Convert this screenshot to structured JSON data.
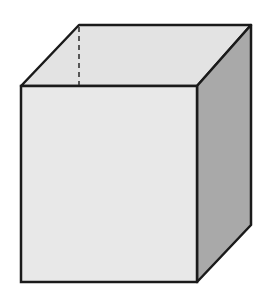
{
  "diagram": {
    "type": "cube",
    "projection": "oblique",
    "colors": {
      "background": "#ffffff",
      "front_face": "#e8e8e8",
      "top_face": "#e3e3e3",
      "side_face": "#a9a9a9",
      "edge": "#1a1a1a"
    },
    "vertices": {
      "front_top_left": [
        21,
        86
      ],
      "front_top_right": [
        197,
        86
      ],
      "front_bottom_right": [
        197,
        282
      ],
      "front_bottom_left": [
        21,
        282
      ],
      "back_top_left": [
        79,
        25
      ],
      "back_top_right": [
        251,
        25
      ],
      "back_bottom_right": [
        251,
        225
      ]
    },
    "hidden_edge": {
      "from": [
        79,
        25
      ],
      "to": [
        79,
        86
      ],
      "style": "dashed"
    }
  }
}
